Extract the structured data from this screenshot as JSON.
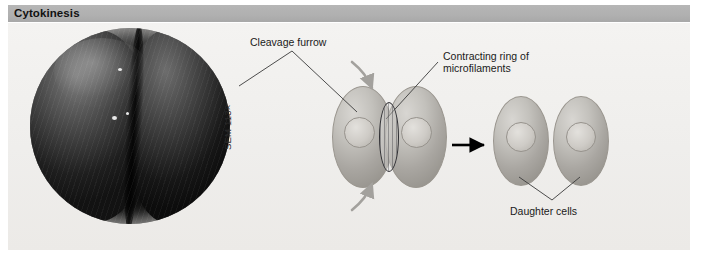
{
  "figure": {
    "header": {
      "title": "Cytokinesis",
      "bar_color": "#b0b0b0"
    },
    "panel": {
      "background_color": "#f2f1ef"
    },
    "micrograph": {
      "type": "SEM",
      "credit": "SEM 113×",
      "description_name": "dividing-cell-micrograph"
    },
    "labels": {
      "cleavage_furrow": "Cleavage furrow",
      "contracting_ring_line1": "Contracting ring of",
      "contracting_ring_line2": "microfilaments",
      "daughter_cells": "Daughter cells"
    },
    "stages": [
      {
        "name": "furrowing-cell",
        "cell_count": 2,
        "nuclei": 2,
        "has_contracting_ring": true,
        "arrow_hint": "inward-curved-arrows"
      },
      {
        "name": "separated-daughter-cells",
        "cell_count": 2,
        "nuclei": 2,
        "has_contracting_ring": false
      }
    ],
    "transition_arrow": "→",
    "colors": {
      "cell_fill": "#c3c1bc",
      "nucleus_fill": "#cecbc6",
      "ring_stroke": "#2f2f33",
      "leader_line": "#3a3a3a",
      "process_arrow": "#9e9c98",
      "transition_arrow": "#000000"
    }
  }
}
